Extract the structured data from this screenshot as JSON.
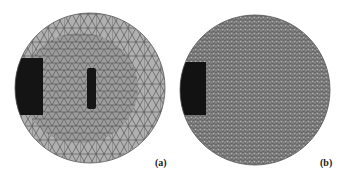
{
  "figure": {
    "panels": [
      {
        "id": "a",
        "label": "(a)",
        "description": "Adaptive triangular mesh: coarse outer region, refined interior with dense block at left edge and dense vertical slot at center"
      },
      {
        "id": "b",
        "label": "(b)",
        "description": "Uniform fine triangular mesh with dense block at left edge"
      }
    ],
    "colors": {
      "mesh_fill": "#a8a8a8",
      "mesh_line": "#4a4a4a",
      "dense": "#111111",
      "fine_fill": "#8c8c8c"
    }
  }
}
